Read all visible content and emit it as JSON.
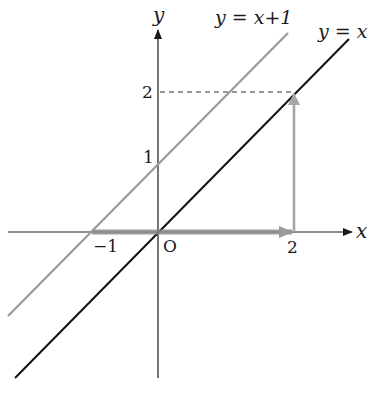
{
  "diagram": {
    "type": "coordinate-graph",
    "axes": {
      "x_label": "x",
      "y_label": "y",
      "origin_label": "O",
      "x_ticks": [
        {
          "value": -1,
          "label": "−1"
        },
        {
          "value": 2,
          "label": "2"
        }
      ],
      "y_ticks": [
        {
          "value": 1,
          "label": "1"
        },
        {
          "value": 2,
          "label": "2"
        }
      ]
    },
    "lines": [
      {
        "name": "y = x + 1",
        "label": "y = x+1",
        "color": "#9a9a9a"
      },
      {
        "name": "y = x",
        "label": "y = x",
        "color": "#111111"
      }
    ],
    "arrows": [
      {
        "from": [
          -1,
          0
        ],
        "to": [
          2,
          0
        ],
        "color": "#8c8c8c",
        "description": "horizontal translation arrow from -1 to 2"
      },
      {
        "from": [
          2,
          0
        ],
        "to": [
          2,
          2
        ],
        "color": "#a0a0a0",
        "description": "vertical arrow from x=2 up to point (2,2)"
      }
    ],
    "guides": [
      {
        "type": "dashed",
        "from": [
          0,
          2
        ],
        "to": [
          2,
          2
        ]
      }
    ],
    "colors": {
      "axis": "#1a1a1a",
      "gray_line": "#9a9a9a",
      "black_line": "#111111",
      "arrow": "#8c8c8c"
    }
  }
}
